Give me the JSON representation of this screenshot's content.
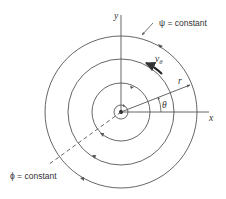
{
  "diagram": {
    "center": [
      121,
      112
    ],
    "colors": {
      "stroke": "#555555",
      "text": "#333333",
      "background": "#ffffff"
    },
    "circles": [
      {
        "name": "core",
        "r": 7
      },
      {
        "name": "streamline-1",
        "r": 29
      },
      {
        "name": "streamline-2",
        "r": 53
      },
      {
        "name": "streamline-3",
        "r": 76
      }
    ],
    "axes": {
      "x_label": "x",
      "y_label": "y"
    },
    "labels": {
      "psi": "ψ = constant",
      "phi": "ϕ = constant",
      "v_theta": "v",
      "v_theta_sub": "θ",
      "r": "r",
      "theta": "θ"
    }
  }
}
